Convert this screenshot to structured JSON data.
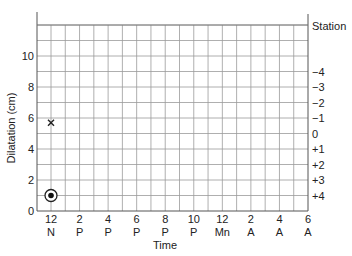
{
  "chart_data": {
    "type": "scatter",
    "title": "",
    "xlabel": "Time",
    "ylabel": "Dilatation (cm)",
    "right_axis_label": "Station",
    "ylim": [
      0,
      12
    ],
    "yticks": [
      0,
      2,
      4,
      6,
      8,
      10
    ],
    "grid": true,
    "x_hours_start": 0,
    "x_hours_end": 18,
    "xticks": [
      {
        "hour": 0,
        "top": "12",
        "bottom": "N"
      },
      {
        "hour": 2,
        "top": "2",
        "bottom": "P"
      },
      {
        "hour": 4,
        "top": "4",
        "bottom": "P"
      },
      {
        "hour": 6,
        "top": "6",
        "bottom": "P"
      },
      {
        "hour": 8,
        "top": "8",
        "bottom": "P"
      },
      {
        "hour": 10,
        "top": "10",
        "bottom": "P"
      },
      {
        "hour": 12,
        "top": "12",
        "bottom": "Mn"
      },
      {
        "hour": 14,
        "top": "2",
        "bottom": "A"
      },
      {
        "hour": 16,
        "top": "4",
        "bottom": "A"
      },
      {
        "hour": 18,
        "top": "6",
        "bottom": "A"
      }
    ],
    "station_ticks": [
      {
        "label": "−4",
        "dilatation": 9
      },
      {
        "label": "−3",
        "dilatation": 8
      },
      {
        "label": "−2",
        "dilatation": 7
      },
      {
        "label": "−1",
        "dilatation": 6
      },
      {
        "label": "0",
        "dilatation": 5
      },
      {
        "label": "+1",
        "dilatation": 4
      },
      {
        "label": "+2",
        "dilatation": 3
      },
      {
        "label": "+3",
        "dilatation": 2
      },
      {
        "label": "+4",
        "dilatation": 1
      }
    ],
    "series": [
      {
        "name": "Station",
        "marker": "x",
        "points": [
          {
            "hour": 0,
            "dilatation": 5.7
          }
        ]
      },
      {
        "name": "Dilatation",
        "marker": "circled-dot",
        "points": [
          {
            "hour": 0,
            "dilatation": 1
          }
        ]
      }
    ]
  }
}
